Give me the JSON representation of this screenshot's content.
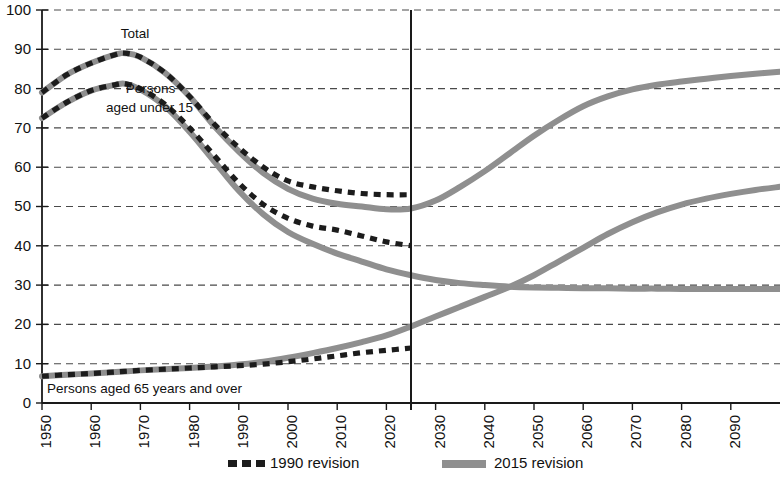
{
  "chart_data": {
    "type": "line",
    "title": "",
    "subtitle": "",
    "xlabel": "",
    "ylabel": "",
    "xlim": [
      1950,
      2100
    ],
    "ylim": [
      0,
      100
    ],
    "grid": true,
    "legend_position": "bottom",
    "x_ticks": [
      "1950",
      "1960",
      "1970",
      "1980",
      "1990",
      "2000",
      "2010",
      "2020",
      "2030",
      "2040",
      "2050",
      "2060",
      "2070",
      "2080",
      "2090"
    ],
    "x_tick_values": [
      1950,
      1960,
      1970,
      1980,
      1990,
      2000,
      2010,
      2020,
      2030,
      2040,
      2050,
      2060,
      2070,
      2080,
      2090
    ],
    "y_ticks": [
      "0",
      "10",
      "20",
      "30",
      "40",
      "50",
      "60",
      "70",
      "80",
      "90",
      "100"
    ],
    "y_tick_values": [
      0,
      10,
      20,
      30,
      40,
      50,
      60,
      70,
      80,
      90,
      100
    ],
    "projection_divider_year": 2025,
    "annotations": [
      {
        "id": "total",
        "text": "Total",
        "x": 1966,
        "y": 93
      },
      {
        "id": "under15-line1",
        "text": "Persons",
        "x": 1967,
        "y": 79
      },
      {
        "id": "under15-line2",
        "text": "aged under 15",
        "x": 1963,
        "y": 74
      },
      {
        "id": "over65",
        "text": "Persons aged 65 years and over",
        "x": 1951,
        "y": 2.5
      }
    ],
    "series": [
      {
        "name": "Total — 1990 revision",
        "revision": "1990 revision",
        "group": "total",
        "style": "dashed",
        "color": "#1c1c1c",
        "x": [
          1950,
          1955,
          1960,
          1965,
          1967,
          1970,
          1975,
          1980,
          1985,
          1990,
          1995,
          2000,
          2005,
          2010,
          2015,
          2020,
          2025
        ],
        "values": [
          79,
          83.5,
          86.5,
          88.7,
          89.0,
          88.0,
          84.0,
          78.0,
          71.0,
          65.0,
          60.0,
          56.5,
          55.0,
          54.0,
          53.3,
          53.0,
          53.0
        ]
      },
      {
        "name": "Total — 2015 revision",
        "revision": "2015 revision",
        "group": "total",
        "style": "solid",
        "color": "#8f8f8f",
        "x": [
          1950,
          1955,
          1960,
          1965,
          1967,
          1970,
          1975,
          1980,
          1985,
          1990,
          1995,
          2000,
          2005,
          2010,
          2015,
          2020,
          2025,
          2030,
          2035,
          2040,
          2045,
          2050,
          2055,
          2060,
          2065,
          2070,
          2075,
          2080,
          2085,
          2090,
          2095,
          2100
        ],
        "values": [
          79,
          83.5,
          86.5,
          88.7,
          89.0,
          88.0,
          84.0,
          78.0,
          70.5,
          64.0,
          58.5,
          54.5,
          52.0,
          50.7,
          50.0,
          49.3,
          49.5,
          51.5,
          55.0,
          59.0,
          63.5,
          68.0,
          72.0,
          75.5,
          78.0,
          79.8,
          81.0,
          81.8,
          82.5,
          83.2,
          83.8,
          84.3
        ]
      },
      {
        "name": "Persons aged under 15 — 1990 revision",
        "revision": "1990 revision",
        "group": "under15",
        "style": "dashed",
        "color": "#1c1c1c",
        "x": [
          1950,
          1955,
          1960,
          1965,
          1967,
          1970,
          1975,
          1980,
          1985,
          1990,
          1995,
          2000,
          2005,
          2010,
          2015,
          2020,
          2025
        ],
        "values": [
          72.5,
          76.5,
          79.5,
          81.0,
          81.2,
          80.0,
          76.0,
          70.0,
          63.0,
          56.0,
          50.5,
          47.0,
          45.0,
          44.0,
          42.5,
          41.0,
          40.0
        ]
      },
      {
        "name": "Persons aged under 15 — 2015 revision",
        "revision": "2015 revision",
        "group": "under15",
        "style": "solid",
        "color": "#8f8f8f",
        "x": [
          1950,
          1955,
          1960,
          1965,
          1967,
          1970,
          1975,
          1980,
          1985,
          1990,
          1995,
          2000,
          2005,
          2010,
          2015,
          2020,
          2025,
          2030,
          2035,
          2040,
          2045,
          2050,
          2055,
          2060,
          2065,
          2070,
          2075,
          2080,
          2085,
          2090,
          2095,
          2100
        ],
        "values": [
          72.5,
          76.5,
          79.5,
          81.0,
          81.2,
          79.8,
          75.5,
          69.0,
          61.5,
          54.0,
          48.0,
          43.5,
          40.5,
          38.0,
          36.0,
          34.0,
          32.5,
          31.3,
          30.5,
          30.0,
          29.6,
          29.4,
          29.3,
          29.2,
          29.2,
          29.1,
          29.1,
          29.0,
          29.0,
          29.0,
          29.0,
          29.0
        ]
      },
      {
        "name": "Persons aged 65 years and over — 1990 revision",
        "revision": "1990 revision",
        "group": "over65",
        "style": "dashed",
        "color": "#1c1c1c",
        "x": [
          1950,
          1955,
          1960,
          1965,
          1970,
          1975,
          1980,
          1985,
          1990,
          1995,
          2000,
          2005,
          2010,
          2015,
          2020,
          2025
        ],
        "values": [
          6.8,
          7.2,
          7.5,
          7.9,
          8.3,
          8.6,
          8.9,
          9.2,
          9.5,
          9.9,
          10.5,
          11.2,
          12.0,
          12.8,
          13.4,
          14.0
        ]
      },
      {
        "name": "Persons aged 65 years and over — 2015 revision",
        "revision": "2015 revision",
        "group": "over65",
        "style": "solid",
        "color": "#8f8f8f",
        "x": [
          1950,
          1955,
          1960,
          1965,
          1970,
          1975,
          1980,
          1985,
          1990,
          1995,
          2000,
          2005,
          2010,
          2015,
          2020,
          2025,
          2030,
          2035,
          2040,
          2045,
          2050,
          2055,
          2060,
          2065,
          2070,
          2075,
          2080,
          2085,
          2090,
          2095,
          2100
        ],
        "values": [
          6.8,
          7.2,
          7.5,
          7.9,
          8.3,
          8.6,
          8.9,
          9.3,
          9.8,
          10.5,
          11.5,
          12.7,
          14.0,
          15.5,
          17.2,
          19.5,
          22.0,
          24.5,
          27.0,
          29.5,
          32.5,
          36.0,
          39.5,
          43.0,
          46.0,
          48.5,
          50.5,
          52.0,
          53.2,
          54.2,
          55.0
        ]
      }
    ],
    "legend": [
      {
        "id": "legend-1990",
        "label": "1990 revision",
        "style": "dashed",
        "color": "#1c1c1c"
      },
      {
        "id": "legend-2015",
        "label": "2015 revision",
        "style": "solid",
        "color": "#8f8f8f"
      }
    ]
  }
}
